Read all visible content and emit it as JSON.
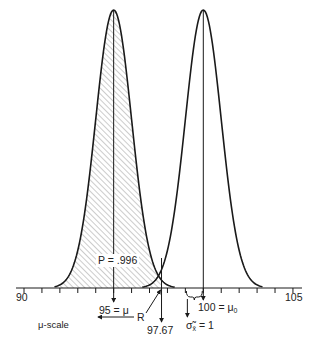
{
  "chart_data": {
    "type": "diagram",
    "title": "",
    "axis": {
      "label": "μ-scale",
      "min": 90,
      "max": 105,
      "tick_step": 1,
      "tick_labels": [
        "90",
        "105"
      ]
    },
    "distributions": [
      {
        "name": "alternative",
        "mean": 95,
        "sd": 1,
        "shaded_to": 97.67,
        "hatched": true
      },
      {
        "name": "null",
        "mean": 100,
        "sd": 1,
        "hatched": false
      }
    ],
    "critical_value": 97.67,
    "annotations": [
      {
        "text": "P = .996",
        "meaning": "area of shaded region"
      },
      {
        "text": "95 = μ",
        "x": 95
      },
      {
        "text": "100 = μ₀",
        "x": 100
      },
      {
        "text": "97.67",
        "x": 97.67
      },
      {
        "text": "R",
        "meaning": "rejection region, arrow pointing left"
      },
      {
        "text": "σ̃x̄ = 1",
        "meaning": "standard error brace"
      }
    ]
  },
  "labels": {
    "tick_90": "90",
    "tick_105": "105",
    "p_label_p": "P",
    "p_label_rest": " = .996",
    "mu_label_num": "95 = ",
    "mu_label_sym": "μ",
    "mu0_label_num": "100 = ",
    "mu0_label_sym": "μ",
    "mu0_sub": "0",
    "critical": "97.67",
    "region": "R",
    "region_arrow": "←",
    "sigma_sym": "σ̃",
    "sigma_sub": "x̄",
    "sigma_rest": " = 1",
    "scale_name": "μ-scale"
  },
  "style": {
    "ink": "#1a1a1a",
    "hatch": "#8a8a8a"
  }
}
